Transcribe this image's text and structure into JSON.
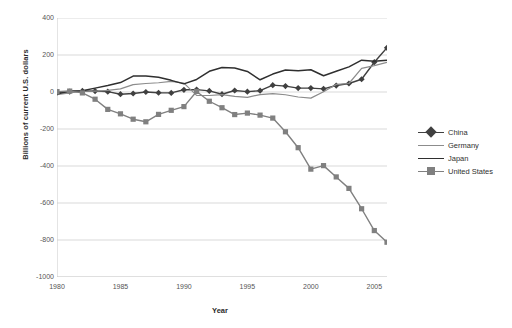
{
  "chart_data": {
    "type": "line",
    "title": "",
    "xlabel": "Year",
    "ylabel": "Billions of current U.S. dollars",
    "xlim": [
      1980,
      2006
    ],
    "ylim": [
      -1000,
      400
    ],
    "ytick_labels": [
      "400",
      "200",
      "0",
      "-200",
      "-400",
      "-600",
      "-800",
      "-1000"
    ],
    "ytick_values": [
      400,
      200,
      0,
      -200,
      -400,
      -600,
      -800,
      -1000
    ],
    "xtick_labels": [
      "1980",
      "1985",
      "1990",
      "1995",
      "2000",
      "2005"
    ],
    "xtick_values": [
      1980,
      1985,
      1990,
      1995,
      2000,
      2005
    ],
    "grid": "horizontal",
    "legend_position": "right",
    "x": [
      1980,
      1981,
      1982,
      1983,
      1984,
      1985,
      1986,
      1987,
      1988,
      1989,
      1990,
      1991,
      1992,
      1993,
      1994,
      1995,
      1996,
      1997,
      1998,
      1999,
      2000,
      2001,
      2002,
      2003,
      2004,
      2005,
      2006
    ],
    "series": [
      {
        "name": "China",
        "color": "#404040",
        "marker": "diamond",
        "line_width": 1.4,
        "values": [
          -3,
          2,
          6,
          5,
          2,
          -12,
          -8,
          0,
          -4,
          -5,
          12,
          13,
          6,
          -12,
          8,
          2,
          7,
          37,
          32,
          21,
          21,
          17,
          35,
          46,
          69,
          161,
          239
        ]
      },
      {
        "name": "Germany",
        "color": "#8c8c8c",
        "marker": "none",
        "line_width": 1.2,
        "values": [
          -14,
          -5,
          5,
          5,
          9,
          17,
          40,
          46,
          50,
          57,
          48,
          -18,
          -19,
          -14,
          -24,
          -29,
          -14,
          -9,
          -15,
          -27,
          -33,
          1,
          41,
          46,
          128,
          143,
          160
        ]
      },
      {
        "name": "Japan",
        "color": "#2f2f2f",
        "marker": "none",
        "line_width": 1.5,
        "values": [
          -11,
          5,
          7,
          21,
          35,
          51,
          86,
          87,
          80,
          63,
          44,
          68,
          112,
          132,
          130,
          111,
          66,
          97,
          119,
          115,
          120,
          88,
          112,
          136,
          172,
          166,
          171
        ]
      },
      {
        "name": "United States",
        "color": "#808080",
        "marker": "square",
        "line_width": 1.4,
        "values": [
          2,
          5,
          -5,
          -39,
          -94,
          -118,
          -147,
          -161,
          -121,
          -99,
          -79,
          3,
          -50,
          -85,
          -122,
          -114,
          -125,
          -141,
          -215,
          -301,
          -417,
          -398,
          -459,
          -521,
          -631,
          -749,
          -812
        ]
      }
    ]
  }
}
